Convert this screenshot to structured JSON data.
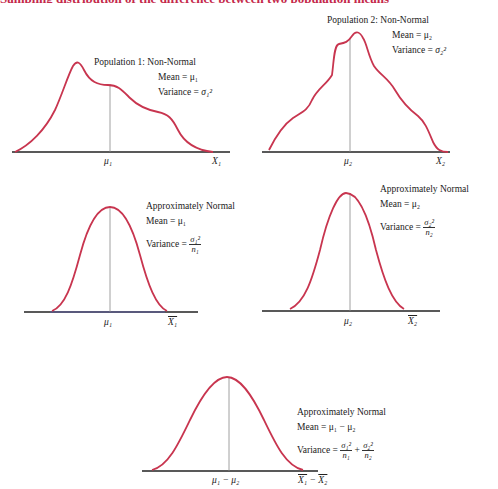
{
  "heading_fragment": "Sampling distribution of the difference between two population means",
  "colors": {
    "curve": "#c8354f",
    "axis": "#222222",
    "mean_line": "#888888",
    "heading": "#c4284a"
  },
  "panels": [
    {
      "id": "pop1",
      "title": "Population 1:  Non-Normal",
      "mean": "Mean = μ₁",
      "variance_label": "Variance = ",
      "variance": "σ₁²",
      "center_label": "μ₁",
      "axis_label": "X₁"
    },
    {
      "id": "pop2",
      "title": "Population 2:  Non-Normal",
      "mean": "Mean = μ₂",
      "variance_label": "Variance = ",
      "variance": "σ₂²",
      "center_label": "μ₂",
      "axis_label": "X₂"
    },
    {
      "id": "xbar1",
      "title": "Approximately Normal",
      "mean": "Mean = μ₁",
      "variance_label": "Variance = ",
      "var_num": "σ₁²",
      "var_den": "n₁",
      "center_label": "μ₁",
      "axis_label": "X₁"
    },
    {
      "id": "xbar2",
      "title": "Approximately Normal",
      "mean": "Mean = μ₂",
      "variance_label": "Variance = ",
      "var_num": "σ₂²",
      "var_den": "n₂",
      "center_label": "μ₂",
      "axis_label": "X₂"
    },
    {
      "id": "diff",
      "title": "Approximately Normal",
      "mean": "Mean = μ₁ − μ₂",
      "variance_label": "Variance = ",
      "var_num1": "σ₁²",
      "var_den1": "n₁",
      "plus": "+",
      "var_num2": "σ₂²",
      "var_den2": "n₂",
      "center_label": "μ₁ − μ₂",
      "axis_label_a": "X₁",
      "axis_minus": " − ",
      "axis_label_b": "X₂"
    }
  ]
}
